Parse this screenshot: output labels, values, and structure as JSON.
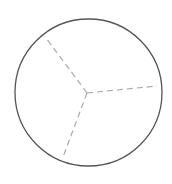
{
  "diagram": {
    "type": "circle-divided-into-three-sectors",
    "colors": {
      "background": "#ffffff",
      "circle_stroke": "#555555",
      "divider_stroke": "#aaaaaa"
    },
    "circle": {
      "cx": 88.5,
      "cy": 92.5,
      "r": 73.5
    },
    "center": {
      "x": 87,
      "y": 93
    },
    "dividers": [
      {
        "x2": 46,
        "y2": 38
      },
      {
        "x2": 157,
        "y2": 86
      },
      {
        "x2": 63,
        "y2": 157
      }
    ]
  }
}
